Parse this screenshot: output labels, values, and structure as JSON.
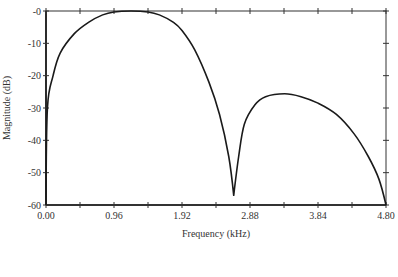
{
  "chart_data": {
    "type": "line",
    "title": "",
    "xlabel": "Frequency (kHz)",
    "ylabel": "Magnitude (dB)",
    "xlim": [
      0,
      4.8
    ],
    "ylim": [
      -60,
      0
    ],
    "grid": false,
    "legend": null,
    "x_ticks": [
      0.0,
      0.48,
      0.96,
      1.44,
      1.92,
      2.4,
      2.88,
      3.36,
      3.84,
      4.32,
      4.8
    ],
    "x_tick_labels": [
      "0.00",
      "",
      "0.96",
      "",
      "1.92",
      "",
      "2.88",
      "",
      "3.84",
      "",
      "4.80"
    ],
    "y_ticks": [
      0,
      -10,
      -20,
      -30,
      -40,
      -50,
      -60
    ],
    "y_tick_labels": [
      "-0",
      "-10",
      "-20",
      "-30",
      "-40",
      "-50",
      "-60"
    ],
    "series": [
      {
        "name": "Magnitude response",
        "x": [
          0.0,
          0.02,
          0.1,
          0.2,
          0.4,
          0.6,
          0.8,
          0.96,
          1.2,
          1.44,
          1.6,
          1.8,
          1.92,
          2.1,
          2.3,
          2.45,
          2.58,
          2.65,
          2.72,
          2.8,
          2.95,
          3.1,
          3.37,
          3.6,
          3.84,
          4.1,
          4.35,
          4.55,
          4.7,
          4.8
        ],
        "y": [
          -60,
          -30,
          -20,
          -13,
          -7,
          -3.5,
          -1.2,
          -0.3,
          0,
          -0.3,
          -1.2,
          -3.5,
          -6,
          -12,
          -22,
          -32,
          -45,
          -57,
          -45,
          -35,
          -29,
          -26.5,
          -25.6,
          -26.5,
          -28.5,
          -32,
          -38,
          -45,
          -52,
          -60
        ]
      }
    ],
    "annotations": []
  }
}
